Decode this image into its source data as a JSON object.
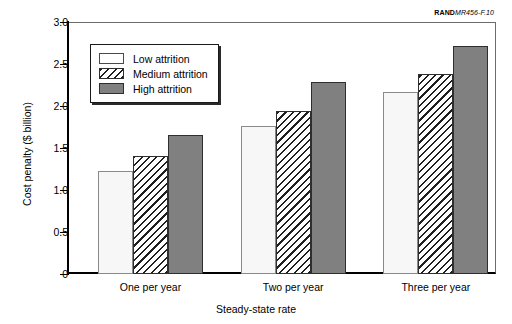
{
  "figure_credit": {
    "prefix": "RAND",
    "suffix": "MR456-F.10"
  },
  "chart_data": {
    "type": "bar",
    "title": "",
    "subtitle": "",
    "xlabel": "Steady-state rate",
    "ylabel": "Cost penalty ($ billion)",
    "categories": [
      "One per year",
      "Two per year",
      "Three per year"
    ],
    "series": [
      {
        "name": "Low attrition",
        "values": [
          1.23,
          1.76,
          2.17
        ],
        "fill": "white",
        "color": "#f7f7f7"
      },
      {
        "name": "Medium attrition",
        "values": [
          1.41,
          1.94,
          2.38
        ],
        "fill": "hatch",
        "color": "#ffffff"
      },
      {
        "name": "High attrition",
        "values": [
          1.65,
          2.28,
          2.71
        ],
        "fill": "gray",
        "color": "#808080"
      }
    ],
    "ylim": [
      0,
      3.0
    ],
    "yticks": [
      0,
      0.5,
      1.0,
      1.5,
      2.0,
      2.5,
      3.0
    ],
    "ytick_labels": [
      "0",
      "0.5",
      "1.0",
      "1.5",
      "2.0",
      "2.5",
      "3.0"
    ],
    "grid": false,
    "legend_position": "upper-left",
    "legend_entries": [
      "Low attrition",
      "Medium attrition",
      "High attrition"
    ]
  }
}
